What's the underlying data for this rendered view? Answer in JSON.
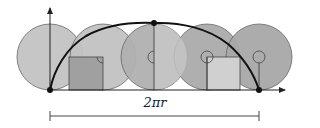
{
  "diagram": {
    "type": "cycloid",
    "label": "2πr",
    "colors": {
      "circle_fill": "#c4c4c4",
      "circle_fill_dark": "#a9a9a9",
      "circle_stroke": "#555555",
      "curve": "#111111",
      "axis": "#222222",
      "rect_dark": "#9e9e9e",
      "rect_light": "#cfcfcf"
    },
    "geometry": {
      "baseline_y": 90,
      "radius": 33,
      "center_y": 57,
      "circle_centers_x": [
        50,
        103,
        154,
        207,
        259
      ],
      "cycloid_start": [
        50,
        90
      ],
      "cycloid_peak": [
        154,
        23
      ],
      "cycloid_end": [
        259,
        90
      ],
      "dimension_line": {
        "x1": 50,
        "x2": 259,
        "y": 116
      }
    }
  }
}
